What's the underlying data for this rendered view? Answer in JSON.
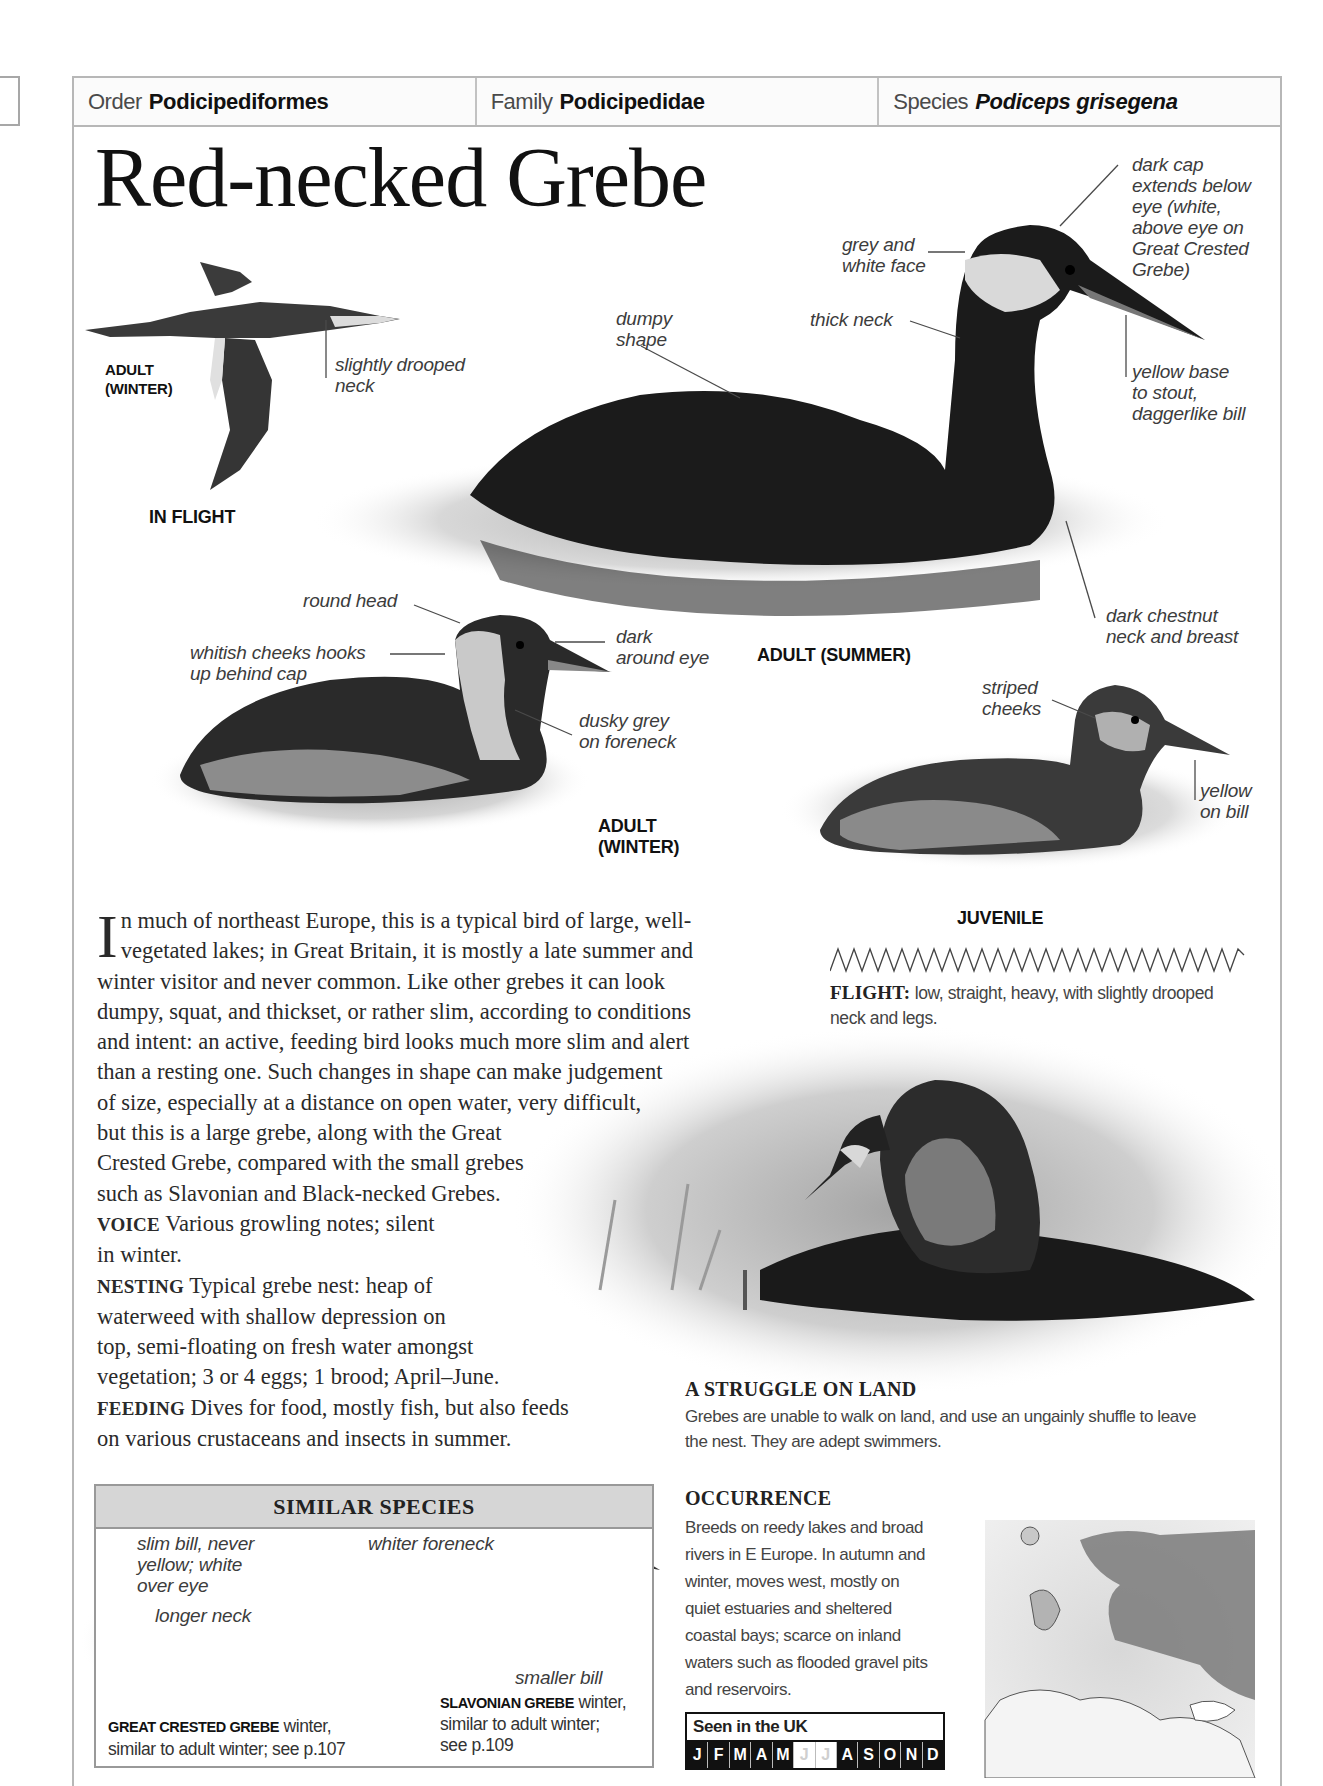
{
  "header": {
    "order": {
      "label": "Order",
      "value": "Podicipediformes"
    },
    "family": {
      "label": "Family",
      "value": "Podicipedidae"
    },
    "species": {
      "label": "Species",
      "value": "Podiceps grisegena"
    }
  },
  "title": "Red-necked Grebe",
  "flight_illustration": {
    "caption": "IN FLIGHT",
    "sub_caption_line1": "ADULT",
    "sub_caption_line2": "(WINTER)",
    "annotations": [
      {
        "line1": "slightly drooped",
        "line2": "neck"
      }
    ]
  },
  "adult_summer": {
    "caption": "ADULT (SUMMER)",
    "annotations": {
      "dumpy": {
        "line1": "dumpy",
        "line2": "shape"
      },
      "face": {
        "line1": "grey and",
        "line2": "white face"
      },
      "neck": {
        "line1": "thick neck"
      },
      "cap": {
        "line1": "dark cap",
        "line2": "extends below",
        "line3": "eye (white,",
        "line4": "above eye on",
        "line5": "Great Crested",
        "line6": "Grebe)"
      },
      "bill": {
        "line1": "yellow base",
        "line2": "to stout,",
        "line3": "daggerlike bill"
      },
      "chestnut": {
        "line1": "dark chestnut",
        "line2": "neck and breast"
      }
    }
  },
  "adult_winter": {
    "caption_line1": "ADULT",
    "caption_line2": "(WINTER)",
    "annotations": {
      "head": {
        "line1": "round head"
      },
      "cheeks": {
        "line1": "whitish cheeks hooks",
        "line2": "up behind cap"
      },
      "eye": {
        "line1": "dark",
        "line2": "around eye"
      },
      "foreneck": {
        "line1": "dusky grey",
        "line2": "on foreneck"
      }
    }
  },
  "juvenile": {
    "caption": "JUVENILE",
    "annotations": {
      "cheeks": {
        "line1": "striped",
        "line2": "cheeks"
      },
      "bill": {
        "line1": "yellow",
        "line2": "on bill"
      }
    }
  },
  "flight_note": {
    "label": "FLIGHT:",
    "text_line1": "low, straight, heavy, with slightly drooped",
    "text_line2": "neck and legs."
  },
  "description": {
    "dropcap": "I",
    "lines": [
      "n much of northeast Europe, this is a typical bird of large, well-",
      "vegetated lakes; in Great Britain, it is mostly a late summer and",
      "winter visitor and never common. Like other grebes it can look",
      "dumpy, squat, and thickset, or rather slim, according to conditions",
      "and intent: an active, feeding bird looks much more slim and alert",
      "than a resting one. Such changes in shape can make judgement",
      "of size, especially at a distance on open water, very difficult,",
      "but this is a large grebe, along with the Great",
      "Crested Grebe, compared with the small grebes",
      "such as Slavonian and Black-necked Grebes."
    ],
    "voice": {
      "label": "VOICE",
      "line1": "Various growling notes; silent",
      "line2": "in winter."
    },
    "nesting": {
      "label": "NESTING",
      "line1": "Typical grebe nest: heap of",
      "line2": "waterweed with shallow depression on",
      "line3": "top, semi-floating on fresh water amongst",
      "line4": "vegetation; 3 or 4 eggs; 1 brood; April–June."
    },
    "feeding": {
      "label": "FEEDING",
      "line1": "Dives for food, mostly fish, but also feeds",
      "line2": "on various crustaceans and insects in summer."
    }
  },
  "nest_photo": {
    "title": "A STRUGGLE ON LAND",
    "line1": "Grebes are unable to walk on land, and use an ungainly shuffle to leave",
    "line2": "the nest. They are adept swimmers."
  },
  "similar_species": {
    "title": "SIMILAR SPECIES",
    "annotations": {
      "slim_bill": {
        "line1": "slim bill, never",
        "line2": "yellow; white",
        "line3": "over eye"
      },
      "longer_neck": {
        "line1": "longer neck"
      },
      "whiter_foreneck": {
        "line1": "whiter foreneck"
      },
      "smaller_bill": {
        "line1": "smaller bill"
      }
    },
    "great_crested": {
      "name": "GREAT CRESTED GREBE",
      "text1": "winter,",
      "text2": "similar to adult winter; see p.107"
    },
    "slavonian": {
      "name": "SLAVONIAN GREBE",
      "text1": "winter,",
      "text2": "similar to adult winter;",
      "text3": "see p.109"
    }
  },
  "occurrence": {
    "title": "OCCURRENCE",
    "lines": [
      "Breeds on reedy lakes and broad",
      "rivers in E Europe. In autumn and",
      "winter, moves west, mostly on",
      "quiet estuaries and sheltered",
      "coastal bays; scarce on inland",
      "waters such as flooded gravel pits",
      "and reservoirs."
    ]
  },
  "seen_in_uk": {
    "label": "Seen in the UK",
    "months": [
      {
        "m": "J",
        "seen": true
      },
      {
        "m": "F",
        "seen": true
      },
      {
        "m": "M",
        "seen": true
      },
      {
        "m": "A",
        "seen": true
      },
      {
        "m": "M",
        "seen": true
      },
      {
        "m": "J",
        "seen": false
      },
      {
        "m": "J",
        "seen": false
      },
      {
        "m": "A",
        "seen": true
      },
      {
        "m": "S",
        "seen": true
      },
      {
        "m": "O",
        "seen": true
      },
      {
        "m": "N",
        "seen": true
      },
      {
        "m": "D",
        "seen": true
      }
    ]
  },
  "colors": {
    "frame": "#b7b7b7",
    "range_shade": "#7a7a7a",
    "similar_header": "#d6d6d6"
  }
}
